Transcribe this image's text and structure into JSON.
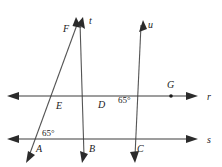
{
  "figure": {
    "type": "geometry-diagram",
    "background_color": "#ffffff",
    "line_color": "#555555",
    "label_color": "#1a1a1a"
  },
  "lines": [
    {
      "name": "r",
      "label": "r",
      "label_x": 210,
      "label_y": 100,
      "orientation": "horizontal",
      "x1": 10,
      "y1": 96,
      "x2": 196,
      "y2": 96,
      "arrow_start": true,
      "arrow_end": true
    },
    {
      "name": "s",
      "label": "s",
      "label_x": 210,
      "label_y": 143,
      "orientation": "horizontal",
      "x1": 10,
      "y1": 139,
      "x2": 196,
      "y2": 139,
      "arrow_start": true,
      "arrow_end": true
    },
    {
      "name": "t",
      "label": "t",
      "label_x": 89,
      "label_y": 24,
      "orientation": "transversal",
      "x1": 82,
      "y1": 19,
      "x2": 135,
      "y2": 160,
      "arrow_start": true,
      "arrow_end": true
    },
    {
      "name": "u",
      "label": "u",
      "label_x": 148,
      "label_y": 28,
      "orientation": "transversal",
      "x1": 143,
      "y1": 22,
      "x2": 83,
      "y2": 160,
      "arrow_start": true,
      "arrow_end": true
    },
    {
      "name": "transversal-F-E-A",
      "label": "",
      "orientation": "transversal",
      "x1": 76,
      "y1": 19,
      "x2": 27,
      "y2": 160,
      "arrow_start": true,
      "arrow_end": true
    }
  ],
  "points": [
    {
      "name": "F",
      "label": "F",
      "x": 77,
      "y": 31,
      "label_x": 63,
      "label_y": 32,
      "dot": false
    },
    {
      "name": "E",
      "label": "E",
      "x": 62,
      "y": 96,
      "label_x": 56,
      "label_y": 109,
      "dot": false
    },
    {
      "name": "D",
      "label": "D",
      "x": 110,
      "y": 96,
      "label_x": 98,
      "label_y": 108,
      "dot": false
    },
    {
      "name": "G",
      "label": "G",
      "x": 171,
      "y": 96,
      "label_x": 167,
      "label_y": 88,
      "dot": true
    },
    {
      "name": "A",
      "label": "A",
      "x": 40,
      "y": 139,
      "label_x": 36,
      "label_y": 152,
      "dot": false
    },
    {
      "name": "B",
      "label": "B",
      "x": 92,
      "y": 139,
      "label_x": 89,
      "label_y": 152,
      "dot": false
    },
    {
      "name": "C",
      "label": "C",
      "x": 140,
      "y": 139,
      "label_x": 137,
      "label_y": 152,
      "dot": false
    }
  ],
  "angles": [
    {
      "name": "angle-at-D",
      "value": "65°",
      "x": 119,
      "y": 103,
      "at_point": "D"
    },
    {
      "name": "angle-at-A",
      "value": "65°",
      "x": 43,
      "y": 136,
      "at_point": "A"
    }
  ]
}
